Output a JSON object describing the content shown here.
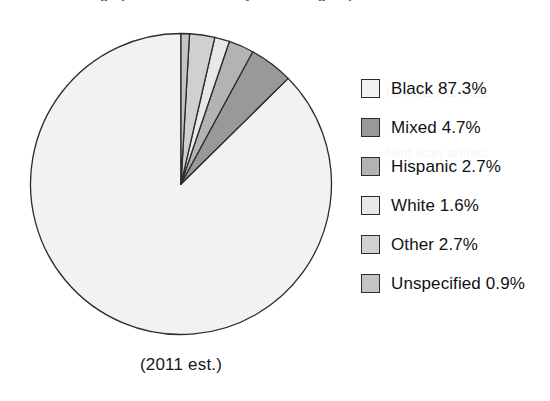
{
  "header": {
    "clipped_title": "Demographics of the country — ethnic groups"
  },
  "ghost_text": {
    "a": "faint scan artifact",
    "b": "faint scan artifact",
    "c": "faint scan artifact",
    "d": "faint scan artifact",
    "e": "faint scan artifact"
  },
  "caption": "(2011 est.)",
  "colors": {
    "outline": "#2b2b2b",
    "background": "#ffffff",
    "black": "#f2f2f2",
    "mixed": "#999999",
    "hispanic": "#b3b3b3",
    "white": "#e8e8e8",
    "other": "#d0d0d0",
    "unspecified": "#c4c4c4"
  },
  "legend": {
    "items": [
      {
        "label": "Black 87.3%",
        "swatch_name": "legend-swatch-black",
        "color": "#f2f2f2"
      },
      {
        "label": "Mixed 4.7%",
        "swatch_name": "legend-swatch-mixed",
        "color": "#999999"
      },
      {
        "label": "Hispanic 2.7%",
        "swatch_name": "legend-swatch-hispanic",
        "color": "#b3b3b3"
      },
      {
        "label": "White 1.6%",
        "swatch_name": "legend-swatch-white",
        "color": "#e8e8e8"
      },
      {
        "label": "Other 2.7%",
        "swatch_name": "legend-swatch-other",
        "color": "#d0d0d0"
      },
      {
        "label": "Unspecified 0.9%",
        "swatch_name": "legend-swatch-unspecified",
        "color": "#c4c4c4"
      }
    ]
  },
  "chart_data": {
    "type": "pie",
    "title": "",
    "subtitle": "(2011 est.)",
    "unit": "%",
    "start_angle_deg": 90,
    "direction": "counterclockwise",
    "legend_position": "right",
    "grid": false,
    "categories": [
      "Black",
      "Mixed",
      "Hispanic",
      "White",
      "Other",
      "Unspecified"
    ],
    "values": [
      87.3,
      4.7,
      2.7,
      1.6,
      2.7,
      0.9
    ],
    "slice_colors": [
      "#f2f2f2",
      "#999999",
      "#b3b3b3",
      "#e8e8e8",
      "#d0d0d0",
      "#c4c4c4"
    ],
    "labels": [
      "Black 87.3%",
      "Mixed 4.7%",
      "Hispanic 2.7%",
      "White 1.6%",
      "Other 2.7%",
      "Unspecified 0.9%"
    ],
    "total": 99.9
  }
}
